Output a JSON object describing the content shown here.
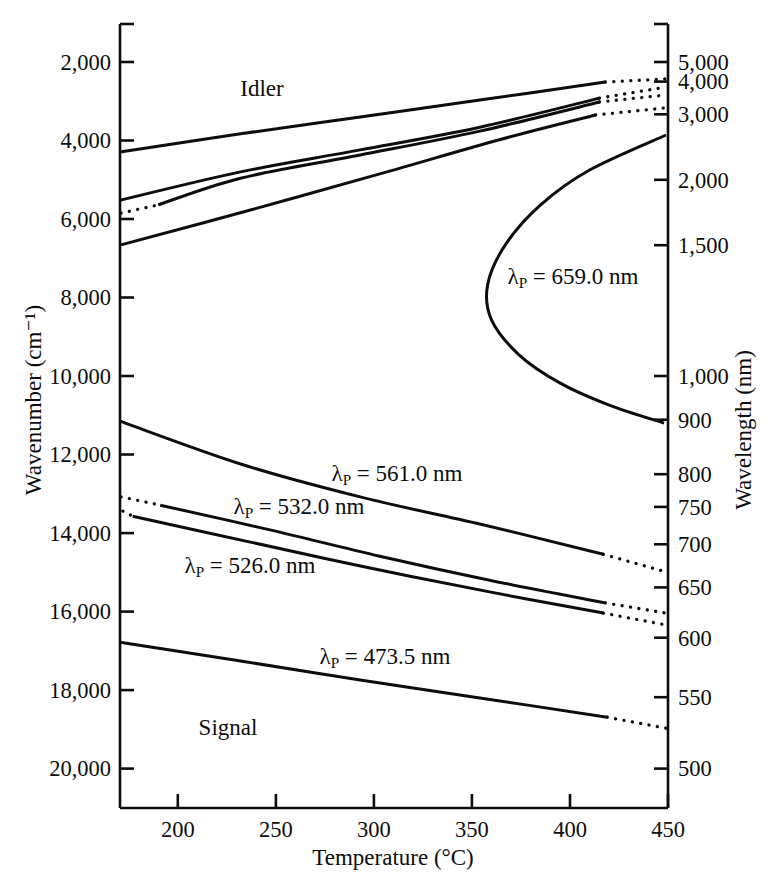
{
  "figure": {
    "background": "#ffffff",
    "ink": "#0d0d0d"
  },
  "labels": {
    "idler": "Idler",
    "signal": "Signal"
  },
  "axes": {
    "x": {
      "title": "Temperature (°C)",
      "range": [
        170.5,
        450
      ],
      "tick_labels": [
        "200",
        "250",
        "300",
        "350",
        "400",
        "450"
      ],
      "tick_values": [
        200,
        250,
        300,
        350,
        400,
        450
      ]
    },
    "y_left": {
      "title": "Wavenumber (cm⁻¹)",
      "range": [
        1000,
        21000
      ],
      "tick_labels": [
        "2,000",
        "4,000",
        "6,000",
        "8,000",
        "10,000",
        "12,000",
        "14,000",
        "16,000",
        "18,000",
        "20,000"
      ],
      "tick_values": [
        2000,
        4000,
        6000,
        8000,
        10000,
        12000,
        14000,
        16000,
        18000,
        20000
      ]
    },
    "y_right": {
      "title": "Wavelength (nm)",
      "tick_labels": [
        "5,000",
        "4,000",
        "3,000",
        "2,000",
        "1,500",
        "1,000",
        "900",
        "800",
        "750",
        "700",
        "650",
        "600",
        "550",
        "500"
      ],
      "tick_values": [
        5000,
        4000,
        3000,
        2000,
        1500,
        1000,
        900,
        800,
        750,
        700,
        650,
        600,
        550,
        500
      ]
    }
  },
  "chart_data": {
    "type": "line",
    "title": "",
    "xlabel": "Temperature (°C)",
    "ylabel_left": "Wavenumber (cm⁻¹)",
    "ylabel_right": "Wavelength (nm)",
    "x_range": [
      170.5,
      450
    ],
    "y_range_wavenumber": [
      1000,
      21000
    ],
    "grid": false,
    "series": [
      {
        "id": "pump-473-5",
        "pump_nm": 473.5,
        "label": {
          "pre": "λ",
          "sub": "P",
          "post": " = 473.5 nm"
        },
        "label_px": {
          "x": 385,
          "y": 657
        },
        "branches": [
          {
            "branch": "signal",
            "segments": [
              {
                "style": "solid",
                "points": [
                  [
                    170.5,
                    16780
                  ],
                  [
                    232,
                    17260
                  ],
                  [
                    293,
                    17740
                  ],
                  [
                    354,
                    18200
                  ],
                  [
                    419,
                    18690
                  ]
                ]
              },
              {
                "style": "dotted",
                "points": [
                  [
                    419,
                    18690
                  ],
                  [
                    449,
                    18970
                  ]
                ]
              }
            ]
          },
          {
            "branch": "idler",
            "segments": [
              {
                "style": "solid",
                "points": [
                  [
                    170.5,
                    4290
                  ],
                  [
                    232,
                    3830
                  ],
                  [
                    293,
                    3400
                  ],
                  [
                    354,
                    2970
                  ],
                  [
                    418,
                    2510
                  ]
                ]
              },
              {
                "style": "dotted",
                "points": [
                  [
                    418,
                    2510
                  ],
                  [
                    449,
                    2430
                  ]
                ]
              }
            ]
          }
        ]
      },
      {
        "id": "pump-526-0",
        "pump_nm": 526.0,
        "label": {
          "pre": "λ",
          "sub": "P",
          "post": " = 526.0 nm"
        },
        "label_px": {
          "x": 250,
          "y": 566
        },
        "branches": [
          {
            "branch": "signal",
            "segments": [
              {
                "style": "dotted",
                "points": [
                  [
                    172,
                    13440
                  ],
                  [
                    177,
                    13570
                  ]
                ]
              },
              {
                "style": "solid",
                "points": [
                  [
                    177,
                    13570
                  ],
                  [
                    237,
                    14230
                  ],
                  [
                    298,
                    14890
                  ],
                  [
                    359,
                    15500
                  ],
                  [
                    417,
                    16040
                  ]
                ]
              },
              {
                "style": "dotted",
                "points": [
                  [
                    417,
                    16040
                  ],
                  [
                    449,
                    16340
                  ]
                ]
              }
            ]
          },
          {
            "branch": "idler",
            "segments": [
              {
                "style": "solid",
                "points": [
                  [
                    170.5,
                    5520
                  ],
                  [
                    232,
                    4800
                  ],
                  [
                    293,
                    4240
                  ],
                  [
                    354,
                    3660
                  ],
                  [
                    415,
                    2920
                  ]
                ]
              },
              {
                "style": "dotted",
                "points": [
                  [
                    415,
                    2920
                  ],
                  [
                    449,
                    2640
                  ]
                ]
              }
            ]
          }
        ]
      },
      {
        "id": "pump-532-0",
        "pump_nm": 532.0,
        "label": {
          "pre": "λ",
          "sub": "P",
          "post": " = 532.0 nm"
        },
        "label_px": {
          "x": 299,
          "y": 507
        },
        "branches": [
          {
            "branch": "signal",
            "segments": [
              {
                "style": "dotted",
                "points": [
                  [
                    171,
                    13080
                  ],
                  [
                    191,
                    13290
                  ]
                ]
              },
              {
                "style": "solid",
                "points": [
                  [
                    191,
                    13290
                  ],
                  [
                    247,
                    13920
                  ],
                  [
                    303,
                    14590
                  ],
                  [
                    359,
                    15200
                  ],
                  [
                    418,
                    15780
                  ]
                ]
              },
              {
                "style": "dotted",
                "points": [
                  [
                    418,
                    15780
                  ],
                  [
                    449,
                    16040
                  ]
                ]
              }
            ]
          },
          {
            "branch": "idler",
            "segments": [
              {
                "style": "dotted",
                "points": [
                  [
                    171,
                    5850
                  ],
                  [
                    190,
                    5640
                  ]
                ]
              },
              {
                "style": "solid",
                "points": [
                  [
                    190,
                    5640
                  ],
                  [
                    232,
                    4960
                  ],
                  [
                    293,
                    4370
                  ],
                  [
                    354,
                    3760
                  ],
                  [
                    415,
                    3020
                  ]
                ]
              },
              {
                "style": "dotted",
                "points": [
                  [
                    415,
                    3020
                  ],
                  [
                    449,
                    2840
                  ]
                ]
              }
            ]
          }
        ]
      },
      {
        "id": "pump-561-0",
        "pump_nm": 561.0,
        "label": {
          "pre": "λ",
          "sub": "P",
          "post": " = 561.0 nm"
        },
        "label_px": {
          "x": 397,
          "y": 474
        },
        "branches": [
          {
            "branch": "signal",
            "segments": [
              {
                "style": "solid",
                "points": [
                  [
                    170.5,
                    11150
                  ],
                  [
                    232,
                    12240
                  ],
                  [
                    293,
                    13080
                  ],
                  [
                    354,
                    13770
                  ],
                  [
                    417,
                    14540
                  ]
                ]
              },
              {
                "style": "dotted",
                "points": [
                  [
                    417,
                    14540
                  ],
                  [
                    449,
                    14990
                  ]
                ]
              }
            ]
          },
          {
            "branch": "idler",
            "segments": [
              {
                "style": "solid",
                "points": [
                  [
                    171,
                    6660
                  ],
                  [
                    237,
                    5770
                  ],
                  [
                    303,
                    4850
                  ],
                  [
                    364,
                    3980
                  ],
                  [
                    413,
                    3350
                  ]
                ]
              },
              {
                "style": "dotted",
                "points": [
                  [
                    413,
                    3350
                  ],
                  [
                    449,
                    3170
                  ]
                ]
              }
            ]
          }
        ]
      },
      {
        "id": "pump-659-0",
        "pump_nm": 659.0,
        "label": {
          "pre": "λ",
          "sub": "P",
          "post": " = 659.0 nm"
        },
        "label_px": {
          "x": 573,
          "y": 277
        },
        "branches": [
          {
            "branch": "signal-idler",
            "segments": [
              {
                "style": "solid",
                "points": [
                  [
                    449,
                    3860
                  ],
                  [
                    410,
                    4750
                  ],
                  [
                    385,
                    5640
                  ],
                  [
                    367,
                    6660
                  ],
                  [
                    358,
                    7680
                  ],
                  [
                    360,
                    8570
                  ],
                  [
                    374,
                    9460
                  ],
                  [
                    395,
                    10180
                  ],
                  [
                    420,
                    10740
                  ],
                  [
                    448,
                    11200
                  ]
                ]
              }
            ]
          }
        ]
      }
    ]
  }
}
